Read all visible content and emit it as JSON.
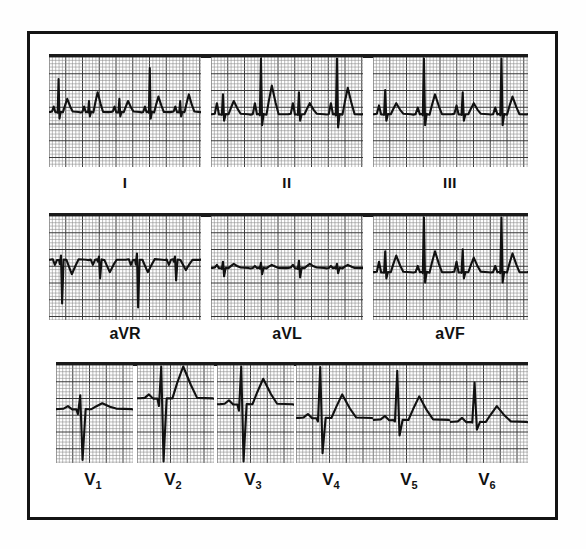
{
  "figure": {
    "border_color": "#141414",
    "background": "#ffffff",
    "grid_color_fine": "#8d8d8d",
    "grid_color_bold": "#3a3a3a",
    "trace_color": "#111111"
  },
  "rows": [
    {
      "name": "limb-leads",
      "top": 57,
      "panel_height": 110,
      "bar_top": 54,
      "panels": [
        {
          "label": "I",
          "label_key": "roman",
          "x": 49,
          "width": 152,
          "caption_x": 125,
          "caption_y": 174
        },
        {
          "label": "II",
          "label_key": "roman",
          "x": 211,
          "width": 152,
          "caption_x": 287,
          "caption_y": 174
        },
        {
          "label": "III",
          "label_key": "roman",
          "x": 373,
          "width": 155,
          "caption_x": 450,
          "caption_y": 174
        }
      ]
    },
    {
      "name": "augmented-leads",
      "top": 216,
      "panel_height": 104,
      "bar_top": 213,
      "panels": [
        {
          "label": "aVR",
          "label_key": "aug",
          "x": 49,
          "width": 152,
          "caption_x": 125,
          "caption_y": 325
        },
        {
          "label": "aVL",
          "label_key": "aug",
          "x": 211,
          "width": 152,
          "caption_x": 287,
          "caption_y": 325
        },
        {
          "label": "aVF",
          "label_key": "aug",
          "x": 373,
          "width": 155,
          "caption_x": 450,
          "caption_y": 325
        }
      ]
    },
    {
      "name": "precordial-leads",
      "top": 365,
      "panel_height": 98,
      "bar_top": 362,
      "panels": [
        {
          "label": "V",
          "sub": "1",
          "label_key": "v",
          "x": 56,
          "width": 77,
          "caption_x": 93,
          "caption_y": 470
        },
        {
          "label": "V",
          "sub": "2",
          "label_key": "v",
          "x": 137,
          "width": 77,
          "caption_x": 173,
          "caption_y": 470
        },
        {
          "label": "V",
          "sub": "3",
          "label_key": "v",
          "x": 217,
          "width": 77,
          "caption_x": 253,
          "caption_y": 470
        },
        {
          "label": "V",
          "sub": "4",
          "label_key": "v",
          "x": 296,
          "width": 77,
          "caption_x": 331,
          "caption_y": 470
        },
        {
          "label": "V",
          "sub": "5",
          "label_key": "v",
          "x": 373,
          "width": 77,
          "caption_x": 409,
          "caption_y": 470
        },
        {
          "label": "V",
          "sub": "6",
          "label_key": "v",
          "x": 450,
          "width": 78,
          "caption_x": 487,
          "caption_y": 470
        }
      ]
    }
  ],
  "chart_data": {
    "type": "line",
    "xlabel": "time",
    "ylabel": "voltage",
    "grid": "ecg-graph-paper 1mm fine / 5mm bold",
    "paper_speed": "25 mm/s",
    "calibration": "10 mm/mV",
    "legend_position": "below-each-panel",
    "series": [
      {
        "name": "I",
        "description": "low amplitude small r waves with upright P and T waves, 5 complexes",
        "baseline_frac": 0.5,
        "beats": [
          {
            "p": 0.05,
            "r": 0.3,
            "s": -0.06,
            "t": 0.12
          },
          {
            "p": 0.05,
            "r": 0.1,
            "s": -0.04,
            "t": 0.18
          },
          {
            "p": 0.05,
            "r": 0.12,
            "s": -0.04,
            "t": 0.1
          },
          {
            "p": 0.05,
            "r": 0.4,
            "s": -0.06,
            "t": 0.14
          },
          {
            "p": 0.05,
            "r": 0.1,
            "s": -0.04,
            "t": 0.16
          }
        ]
      },
      {
        "name": "II",
        "description": "upright tall R waves with prominent P and T waves, 4 complexes",
        "baseline_frac": 0.52,
        "beats": [
          {
            "p": 0.1,
            "r": 0.18,
            "s": -0.06,
            "t": 0.12
          },
          {
            "p": 0.1,
            "r": 0.62,
            "s": -0.1,
            "t": 0.26
          },
          {
            "p": 0.1,
            "r": 0.2,
            "s": -0.06,
            "t": 0.1
          },
          {
            "p": 0.1,
            "r": 0.72,
            "s": -0.12,
            "t": 0.24
          }
        ]
      },
      {
        "name": "III",
        "description": "upright R waves of moderate amplitude with small P waves, 4 complexes",
        "baseline_frac": 0.52,
        "beats": [
          {
            "p": 0.08,
            "r": 0.22,
            "s": -0.06,
            "t": 0.1
          },
          {
            "p": 0.06,
            "r": 0.56,
            "s": -0.1,
            "t": 0.18
          },
          {
            "p": 0.08,
            "r": 0.2,
            "s": -0.06,
            "t": 0.1
          },
          {
            "p": 0.06,
            "r": 0.58,
            "s": -0.1,
            "t": 0.16
          }
        ]
      },
      {
        "name": "aVR",
        "description": "predominantly negative QRS complexes with inverted P and T waves",
        "baseline_frac": 0.42,
        "beats": [
          {
            "p": -0.05,
            "r": 0.04,
            "s": -0.42,
            "t": -0.14
          },
          {
            "p": -0.05,
            "r": 0.03,
            "s": -0.18,
            "t": -0.12
          },
          {
            "p": -0.05,
            "r": 0.06,
            "s": -0.46,
            "t": -0.12
          },
          {
            "p": -0.05,
            "r": 0.03,
            "s": -0.2,
            "t": -0.1
          }
        ]
      },
      {
        "name": "aVL",
        "description": "very low amplitude nearly isoelectric complexes",
        "baseline_frac": 0.5,
        "beats": [
          {
            "p": 0.03,
            "r": 0.06,
            "s": -0.08,
            "t": 0.04
          },
          {
            "p": 0.02,
            "r": 0.05,
            "s": -0.06,
            "t": 0.03
          },
          {
            "p": 0.03,
            "r": 0.07,
            "s": -0.09,
            "t": 0.04
          },
          {
            "p": 0.02,
            "r": 0.04,
            "s": -0.05,
            "t": 0.03
          }
        ]
      },
      {
        "name": "aVF",
        "description": "tall upright R waves with rounded T waves",
        "baseline_frac": 0.54,
        "beats": [
          {
            "p": 0.1,
            "r": 0.2,
            "s": -0.06,
            "t": 0.16
          },
          {
            "p": 0.06,
            "r": 0.66,
            "s": -0.1,
            "t": 0.2
          },
          {
            "p": 0.1,
            "r": 0.22,
            "s": -0.06,
            "t": 0.14
          },
          {
            "p": 0.06,
            "r": 0.7,
            "s": -0.1,
            "t": 0.18
          }
        ]
      },
      {
        "name": "V1",
        "description": "small r wave with deep S wave (rS pattern), flat T wave",
        "baseline_frac": 0.45,
        "beats": [
          {
            "p": 0.03,
            "r": 0.14,
            "s": -0.52,
            "t": 0.06
          }
        ]
      },
      {
        "name": "V2",
        "description": "rS pattern with very deep S wave and tall broad T wave",
        "baseline_frac": 0.34,
        "beats": [
          {
            "p": 0.04,
            "r": 0.44,
            "s": -0.78,
            "t": 0.34
          }
        ]
      },
      {
        "name": "V3",
        "description": "RS pattern, tall R and deep S with upright T wave",
        "baseline_frac": 0.4,
        "beats": [
          {
            "p": 0.04,
            "r": 0.56,
            "s": -0.66,
            "t": 0.26
          }
        ]
      },
      {
        "name": "V4",
        "description": "tall R wave with deep S wave and upright T wave",
        "baseline_frac": 0.54,
        "beats": [
          {
            "p": 0.04,
            "r": 0.52,
            "s": -0.36,
            "t": 0.24
          }
        ]
      },
      {
        "name": "V5",
        "description": "tall R wave with small S wave and broad upright T wave",
        "baseline_frac": 0.56,
        "beats": [
          {
            "p": 0.04,
            "r": 0.5,
            "s": -0.16,
            "t": 0.24
          }
        ]
      },
      {
        "name": "V6",
        "description": "moderate R wave with minimal S wave and low upright T wave",
        "baseline_frac": 0.58,
        "beats": [
          {
            "p": 0.04,
            "r": 0.4,
            "s": -0.08,
            "t": 0.16
          }
        ]
      }
    ]
  }
}
